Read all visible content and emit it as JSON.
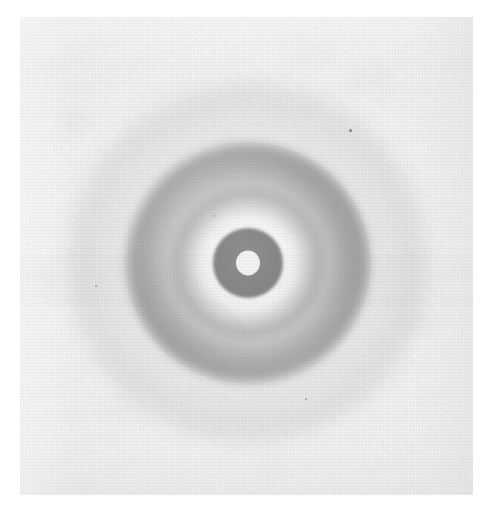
{
  "image": {
    "kind": "photograph",
    "subject": "x-ray-diffraction-pattern",
    "description": "Monochrome photographic print of a powder X-ray / electron diffraction pattern showing concentric diffuse rings about a central opaque beam stop with a bright undiffracted central beam spot.",
    "canvas": {
      "width": 498,
      "height": 512,
      "background_color": "#ffffff"
    },
    "print": {
      "left": 20,
      "top": 17,
      "width": 453,
      "height": 478,
      "base_color": "#efefef",
      "texture": "halftone-grain"
    },
    "alt_text": "Diffraction pattern photograph: dark concentric halos around a black central disc with a white spot."
  },
  "chart_data": {
    "type": "heatmap",
    "title": "",
    "subtitle": "",
    "xlabel": "",
    "ylabel": "",
    "grid": false,
    "legend": "none",
    "geometry": {
      "center_x": 248,
      "center_y": 263,
      "units": "pixels",
      "symmetry": "radial"
    },
    "radial_profile": {
      "x": [
        0,
        6,
        12,
        16,
        22,
        28,
        34,
        40,
        46,
        52,
        58,
        64,
        70,
        76,
        84,
        92,
        100,
        108,
        116,
        124,
        132,
        140,
        152,
        166,
        180,
        200,
        220
      ],
      "xlabel": "radius (px)",
      "ylabel": "optical density (0 = white, 1 = black)",
      "values": [
        0.04,
        0.04,
        0.05,
        0.7,
        0.97,
        0.97,
        0.96,
        0.3,
        0.22,
        0.34,
        0.5,
        0.58,
        0.6,
        0.52,
        0.47,
        0.58,
        0.66,
        0.64,
        0.56,
        0.4,
        0.28,
        0.22,
        0.17,
        0.13,
        0.11,
        0.08,
        0.07
      ],
      "ylim": [
        0,
        1
      ]
    },
    "features": [
      {
        "name": "central-beam-spot",
        "radius_px": 12,
        "density": 0.04,
        "color": "#f4f4f1",
        "note": "bright undiffracted direct beam"
      },
      {
        "name": "beam-stop-disc",
        "radius_px": 34,
        "density": 0.97,
        "color": "#060606",
        "note": "opaque beam stop / saturated core"
      },
      {
        "name": "halo-gap",
        "radius_px": 42,
        "density": 0.22,
        "color": "#c9c9c9",
        "note": "light annulus just outside the stop"
      },
      {
        "name": "inner-diffraction-ring",
        "radius_px": 66,
        "density": 0.6,
        "color": "#4a4a4a",
        "note": "first diffuse ring"
      },
      {
        "name": "main-diffraction-ring",
        "radius_px": 102,
        "density": 0.66,
        "color": "#3d3d3d",
        "note": "broad dominant dark annulus, strongest toward upper-right"
      },
      {
        "name": "outer-diffraction-arc",
        "radius_px": 126,
        "density": 0.3,
        "color": "#8a8a8a",
        "note": "faint outermost arc, most visible top and bottom"
      },
      {
        "name": "background-fog",
        "radius_px": 200,
        "density": 0.07,
        "color": "#e9e9e9",
        "note": "unexposed film base"
      }
    ],
    "artifacts": [
      {
        "name": "dust-speck",
        "x": 350,
        "y": 130,
        "size_px": 3
      },
      {
        "name": "micro-speck",
        "x": 96,
        "y": 286,
        "size_px": 2
      },
      {
        "name": "micro-speck",
        "x": 306,
        "y": 399,
        "size_px": 2
      },
      {
        "name": "micro-speck",
        "x": 214,
        "y": 216,
        "size_px": 2
      }
    ],
    "colors": {
      "darkest": "#050505",
      "brightest": "#f7f7f5",
      "paper": "#efefef",
      "page": "#ffffff"
    }
  }
}
